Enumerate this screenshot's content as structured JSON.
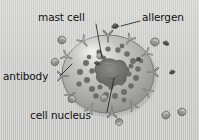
{
  "figure": {
    "type": "biological-illustration",
    "background_color": "#cfcfcf",
    "text_color": "#121212",
    "cell_fill_color": "#a9a9a7",
    "cell_highlight_color": "#e2e2df",
    "granule_color": "#6d6d6b",
    "nucleus_color": "#6a6a68",
    "antibody_color": "#8a8a88",
    "leader_line_color": "#2b2b2b"
  },
  "labels": [
    {
      "id": "mast-cell",
      "text": "mast cell"
    },
    {
      "id": "allergen",
      "text": "allergen"
    },
    {
      "id": "antibody",
      "text": "antibody"
    },
    {
      "id": "cell-nucleus",
      "text": "cell nucleus"
    }
  ],
  "parts": {
    "mast_cell": "mast cell",
    "allergen": "allergen",
    "antibody": "antibody",
    "cell_nucleus": "cell nucleus"
  },
  "counts": {
    "granules": 28,
    "surface_antibodies": 12,
    "free_antibodies": 7,
    "allergens": 3
  }
}
